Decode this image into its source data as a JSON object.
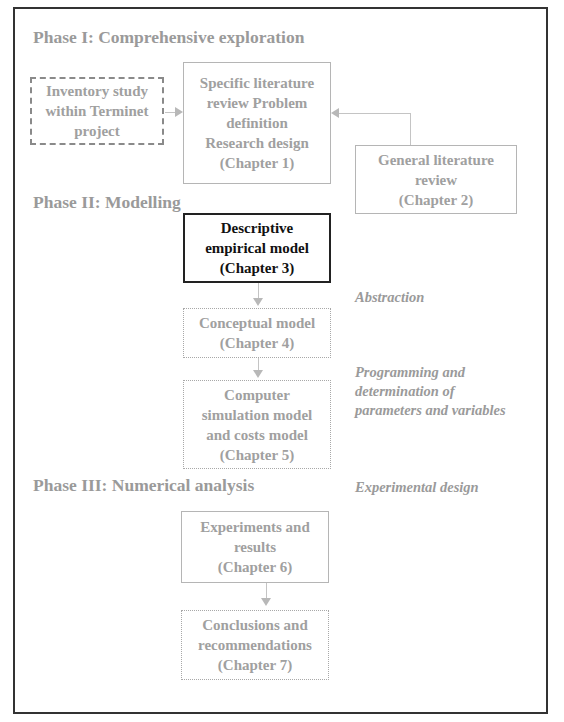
{
  "phases": {
    "phase1": "Phase I: Comprehensive exploration",
    "phase2": "Phase II: Modelling",
    "phase3": "Phase III: Numerical analysis"
  },
  "boxes": {
    "inventory": [
      "Inventory study",
      "within Terminet",
      "project"
    ],
    "specific": [
      "Specific literature",
      "review Problem",
      "definition",
      "Research design",
      "(Chapter 1)"
    ],
    "general": [
      "General literature",
      "review",
      "(Chapter 2)"
    ],
    "descriptive": [
      "Descriptive",
      "empirical model",
      "(Chapter 3)"
    ],
    "conceptual": [
      "Conceptual model",
      "(Chapter 4)"
    ],
    "computer": [
      "Computer",
      "simulation model",
      "and costs model",
      "(Chapter 5)"
    ],
    "experiments": [
      "Experiments and",
      "results",
      "(Chapter  6)"
    ],
    "conclusions": [
      "Conclusions and",
      "recommendations",
      "(Chapter 7)"
    ]
  },
  "notes": {
    "abstraction": "Abstraction",
    "programming": [
      "Programming and",
      "determination of",
      "parameters and variables"
    ],
    "experimental": "Experimental design"
  }
}
